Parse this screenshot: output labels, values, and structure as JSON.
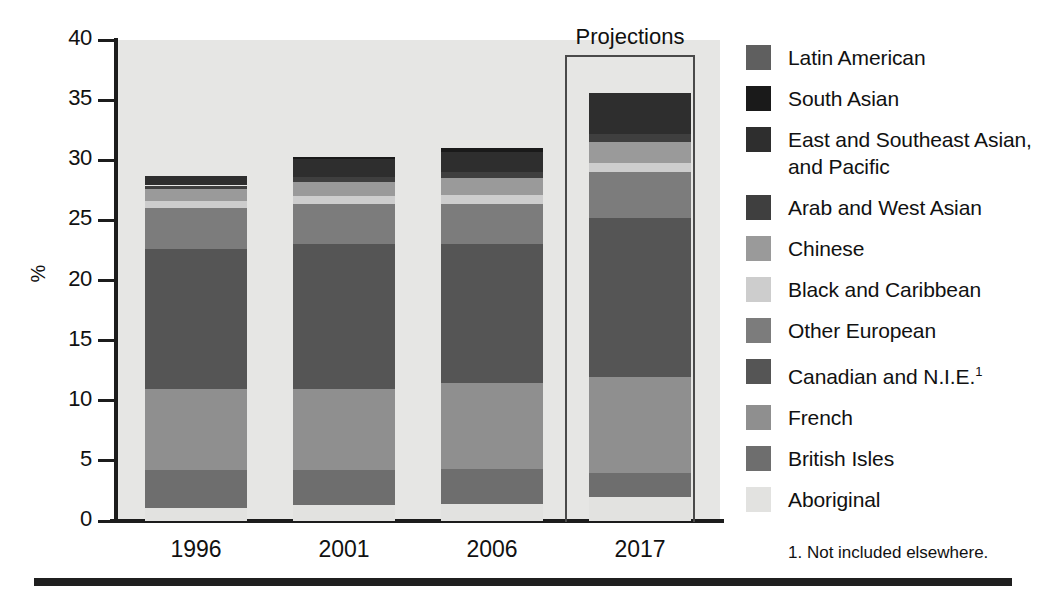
{
  "chart_data": {
    "type": "bar",
    "subtype": "stacked-bar",
    "title": "",
    "xlabel": "",
    "ylabel": "%",
    "ylim": [
      0,
      40
    ],
    "yticks": [
      0,
      5,
      10,
      15,
      20,
      25,
      30,
      35,
      40
    ],
    "ytick_labels": [
      "0",
      "5",
      "10",
      "15",
      "20",
      "25",
      "30",
      "35",
      "40"
    ],
    "grid": false,
    "legend_position": "right",
    "categories": [
      "1996",
      "2001",
      "2006",
      "2017"
    ],
    "annotations": [
      {
        "text": "Projections",
        "covers": [
          "2017"
        ]
      }
    ],
    "footnote": "1. Not included elsewhere.",
    "series": [
      {
        "name": "Aboriginal",
        "color": "#e2e2e0",
        "values": [
          1.1,
          1.3,
          1.4,
          2.0
        ]
      },
      {
        "name": "British Isles",
        "color": "#6e6e6e",
        "values": [
          3.1,
          2.9,
          2.9,
          2.0
        ]
      },
      {
        "name": "French",
        "color": "#8f8f8f",
        "values": [
          6.8,
          6.8,
          7.2,
          8.0
        ]
      },
      {
        "name": "Canadian and N.I.E.",
        "color": "#555555",
        "values": [
          11.6,
          12.0,
          11.5,
          13.2
        ]
      },
      {
        "name": "Other European",
        "color": "#7c7c7c",
        "values": [
          3.4,
          3.4,
          3.4,
          3.8
        ]
      },
      {
        "name": "Black and Caribbean",
        "color": "#cdcdcd",
        "values": [
          0.6,
          0.6,
          0.7,
          0.8
        ]
      },
      {
        "name": "Chinese",
        "color": "#9a9a9a",
        "values": [
          1.0,
          1.2,
          1.4,
          1.7
        ]
      },
      {
        "name": "Arab and West Asian",
        "color": "#3f3f3f",
        "values": [
          0.3,
          0.4,
          0.5,
          0.7
        ]
      },
      {
        "name": "East and Southeast Asian, and Pacific",
        "color": "#2e2e2e",
        "values": [
          0.8,
          1.5,
          1.7,
          3.4
        ]
      },
      {
        "name": "South Asian",
        "color": "#1a1a1a",
        "values": [
          0.0,
          0.2,
          0.3,
          0.0
        ]
      },
      {
        "name": "Latin American",
        "color": "#5f5f5f",
        "values": [
          0.0,
          0.0,
          0.0,
          0.0
        ]
      }
    ],
    "totals": [
      28.7,
      30.3,
      31.0,
      35.6
    ],
    "stack_order_bottom_to_top": [
      "Aboriginal",
      "British Isles",
      "French",
      "Canadian and N.I.E.",
      "Other European",
      "Black and Caribbean",
      "Chinese",
      "Arab and West Asian",
      "East and Southeast Asian, and Pacific",
      "South Asian",
      "Latin American"
    ],
    "bar_segments": {
      "1996": [
        {
          "name": "Aboriginal",
          "from": 0.0,
          "to": 1.1,
          "color": "#e2e2e0"
        },
        {
          "name": "British Isles",
          "from": 1.1,
          "to": 4.2,
          "color": "#6e6e6e"
        },
        {
          "name": "French",
          "from": 4.2,
          "to": 11.0,
          "color": "#8f8f8f"
        },
        {
          "name": "Canadian and N.I.E.",
          "from": 11.0,
          "to": 22.6,
          "color": "#555555"
        },
        {
          "name": "Other European",
          "from": 22.6,
          "to": 26.0,
          "color": "#7c7c7c"
        },
        {
          "name": "Black and Caribbean",
          "from": 26.0,
          "to": 26.6,
          "color": "#cdcdcd"
        },
        {
          "name": "Chinese",
          "from": 26.6,
          "to": 27.6,
          "color": "#9a9a9a"
        },
        {
          "name": "Arab and West Asian",
          "from": 27.6,
          "to": 27.9,
          "color": "#3f3f3f"
        },
        {
          "name": "East and Southeast Asian, and Pacific",
          "from": 27.9,
          "to": 28.7,
          "color": "#2e2e2e"
        }
      ],
      "2001": [
        {
          "name": "Aboriginal",
          "from": 0.0,
          "to": 1.3,
          "color": "#e2e2e0"
        },
        {
          "name": "British Isles",
          "from": 1.3,
          "to": 4.2,
          "color": "#6e6e6e"
        },
        {
          "name": "French",
          "from": 4.2,
          "to": 11.0,
          "color": "#8f8f8f"
        },
        {
          "name": "Canadian and N.I.E.",
          "from": 11.0,
          "to": 23.0,
          "color": "#555555"
        },
        {
          "name": "Other European",
          "from": 23.0,
          "to": 26.4,
          "color": "#7c7c7c"
        },
        {
          "name": "Black and Caribbean",
          "from": 26.4,
          "to": 27.0,
          "color": "#cdcdcd"
        },
        {
          "name": "Chinese",
          "from": 27.0,
          "to": 28.2,
          "color": "#9a9a9a"
        },
        {
          "name": "Arab and West Asian",
          "from": 28.2,
          "to": 28.6,
          "color": "#3f3f3f"
        },
        {
          "name": "East and Southeast Asian, and Pacific",
          "from": 28.6,
          "to": 30.1,
          "color": "#2e2e2e"
        },
        {
          "name": "South Asian",
          "from": 30.1,
          "to": 30.3,
          "color": "#1a1a1a"
        }
      ],
      "2006": [
        {
          "name": "Aboriginal",
          "from": 0.0,
          "to": 1.4,
          "color": "#e2e2e0"
        },
        {
          "name": "British Isles",
          "from": 1.4,
          "to": 4.3,
          "color": "#6e6e6e"
        },
        {
          "name": "French",
          "from": 4.3,
          "to": 11.5,
          "color": "#8f8f8f"
        },
        {
          "name": "Canadian and N.I.E.",
          "from": 11.5,
          "to": 23.0,
          "color": "#555555"
        },
        {
          "name": "Other European",
          "from": 23.0,
          "to": 26.4,
          "color": "#7c7c7c"
        },
        {
          "name": "Black and Caribbean",
          "from": 26.4,
          "to": 27.1,
          "color": "#cdcdcd"
        },
        {
          "name": "Chinese",
          "from": 27.1,
          "to": 28.5,
          "color": "#9a9a9a"
        },
        {
          "name": "Arab and West Asian",
          "from": 28.5,
          "to": 29.0,
          "color": "#3f3f3f"
        },
        {
          "name": "East and Southeast Asian, and Pacific",
          "from": 29.0,
          "to": 30.7,
          "color": "#2e2e2e"
        },
        {
          "name": "South Asian",
          "from": 30.7,
          "to": 31.0,
          "color": "#1a1a1a"
        }
      ],
      "2017": [
        {
          "name": "Aboriginal",
          "from": 0.0,
          "to": 2.0,
          "color": "#e2e2e0"
        },
        {
          "name": "British Isles",
          "from": 2.0,
          "to": 4.0,
          "color": "#6e6e6e"
        },
        {
          "name": "French",
          "from": 4.0,
          "to": 12.0,
          "color": "#8f8f8f"
        },
        {
          "name": "Canadian and N.I.E.",
          "from": 12.0,
          "to": 25.2,
          "color": "#555555"
        },
        {
          "name": "Other European",
          "from": 25.2,
          "to": 29.0,
          "color": "#7c7c7c"
        },
        {
          "name": "Black and Caribbean",
          "from": 29.0,
          "to": 29.8,
          "color": "#cdcdcd"
        },
        {
          "name": "Chinese",
          "from": 29.8,
          "to": 31.5,
          "color": "#9a9a9a"
        },
        {
          "name": "Arab and West Asian",
          "from": 31.5,
          "to": 32.2,
          "color": "#3f3f3f"
        },
        {
          "name": "East and Southeast Asian, and Pacific",
          "from": 32.2,
          "to": 35.6,
          "color": "#2e2e2e"
        }
      ]
    }
  },
  "axis": {
    "y_title": "%",
    "y_tick_labels": [
      "40",
      "35",
      "30",
      "25",
      "20",
      "15",
      "10",
      "5",
      "0"
    ],
    "x_tick_labels": [
      "1996",
      "2001",
      "2006",
      "2017"
    ]
  },
  "projections": {
    "label": "Projections"
  },
  "legend": {
    "items": [
      {
        "label": "Latin American",
        "color": "#5f5f5f"
      },
      {
        "label": "South Asian",
        "color": "#1a1a1a"
      },
      {
        "label": "East and Southeast Asian,\nand Pacific",
        "color": "#2e2e2e"
      },
      {
        "label": "Arab and West Asian",
        "color": "#3f3f3f"
      },
      {
        "label": "Chinese",
        "color": "#9a9a9a"
      },
      {
        "label": "Black and Caribbean",
        "color": "#cdcdcd"
      },
      {
        "label": "Other European",
        "color": "#7c7c7c"
      },
      {
        "label": "Canadian and N.I.E.",
        "color": "#555555",
        "superscript": "1"
      },
      {
        "label": "French",
        "color": "#8f8f8f"
      },
      {
        "label": "British Isles",
        "color": "#6e6e6e"
      },
      {
        "label": "Aboriginal",
        "color": "#e2e2e0"
      }
    ],
    "footnote": "1. Not included elsewhere."
  }
}
